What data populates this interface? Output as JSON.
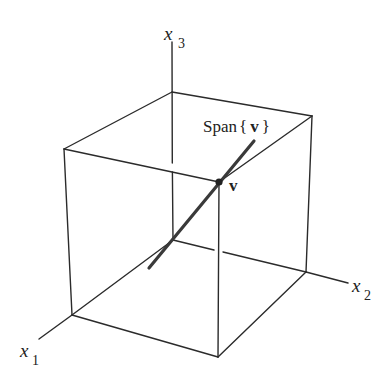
{
  "figure": {
    "axes": {
      "x1": {
        "label": "x",
        "subscript": "1"
      },
      "x2": {
        "label": "x",
        "subscript": "2"
      },
      "x3": {
        "label": "x",
        "subscript": "3"
      }
    },
    "span_label": {
      "prefix": "Span",
      "open": "{",
      "vector": "v",
      "close": "}"
    },
    "point_label": "v",
    "colors": {
      "line": "#2b2b2b",
      "span_line": "#3a3a3a",
      "background": "#ffffff"
    }
  }
}
